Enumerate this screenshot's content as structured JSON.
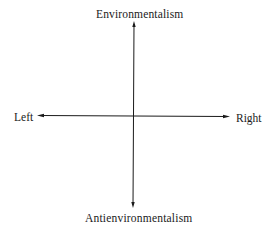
{
  "diagram": {
    "type": "quadrant-axes",
    "axes": {
      "vertical": {
        "top_label": "Environmentalism",
        "bottom_label": "Antienvironmentalism"
      },
      "horizontal": {
        "left_label": "Left",
        "right_label": "Right"
      }
    },
    "colors": {
      "axis": "#1a1a1a",
      "background": "#ffffff",
      "text": "#1a1a1a"
    }
  }
}
